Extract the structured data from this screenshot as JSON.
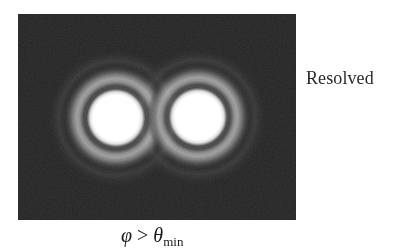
{
  "figure": {
    "background_color": "#222222",
    "disk_color": "#ffffff",
    "ring_color": "#8a8a8a",
    "patterns": [
      {
        "name": "left-airy-pattern",
        "cx": 98,
        "cy": 104,
        "disk_radius": 23
      },
      {
        "name": "right-airy-pattern",
        "cx": 180,
        "cy": 103,
        "disk_radius": 23
      }
    ]
  },
  "labels": {
    "side": "Resolved",
    "caption": {
      "lhs": "φ",
      "operator": ">",
      "rhs": "θ",
      "rhs_subscript": "min"
    }
  }
}
